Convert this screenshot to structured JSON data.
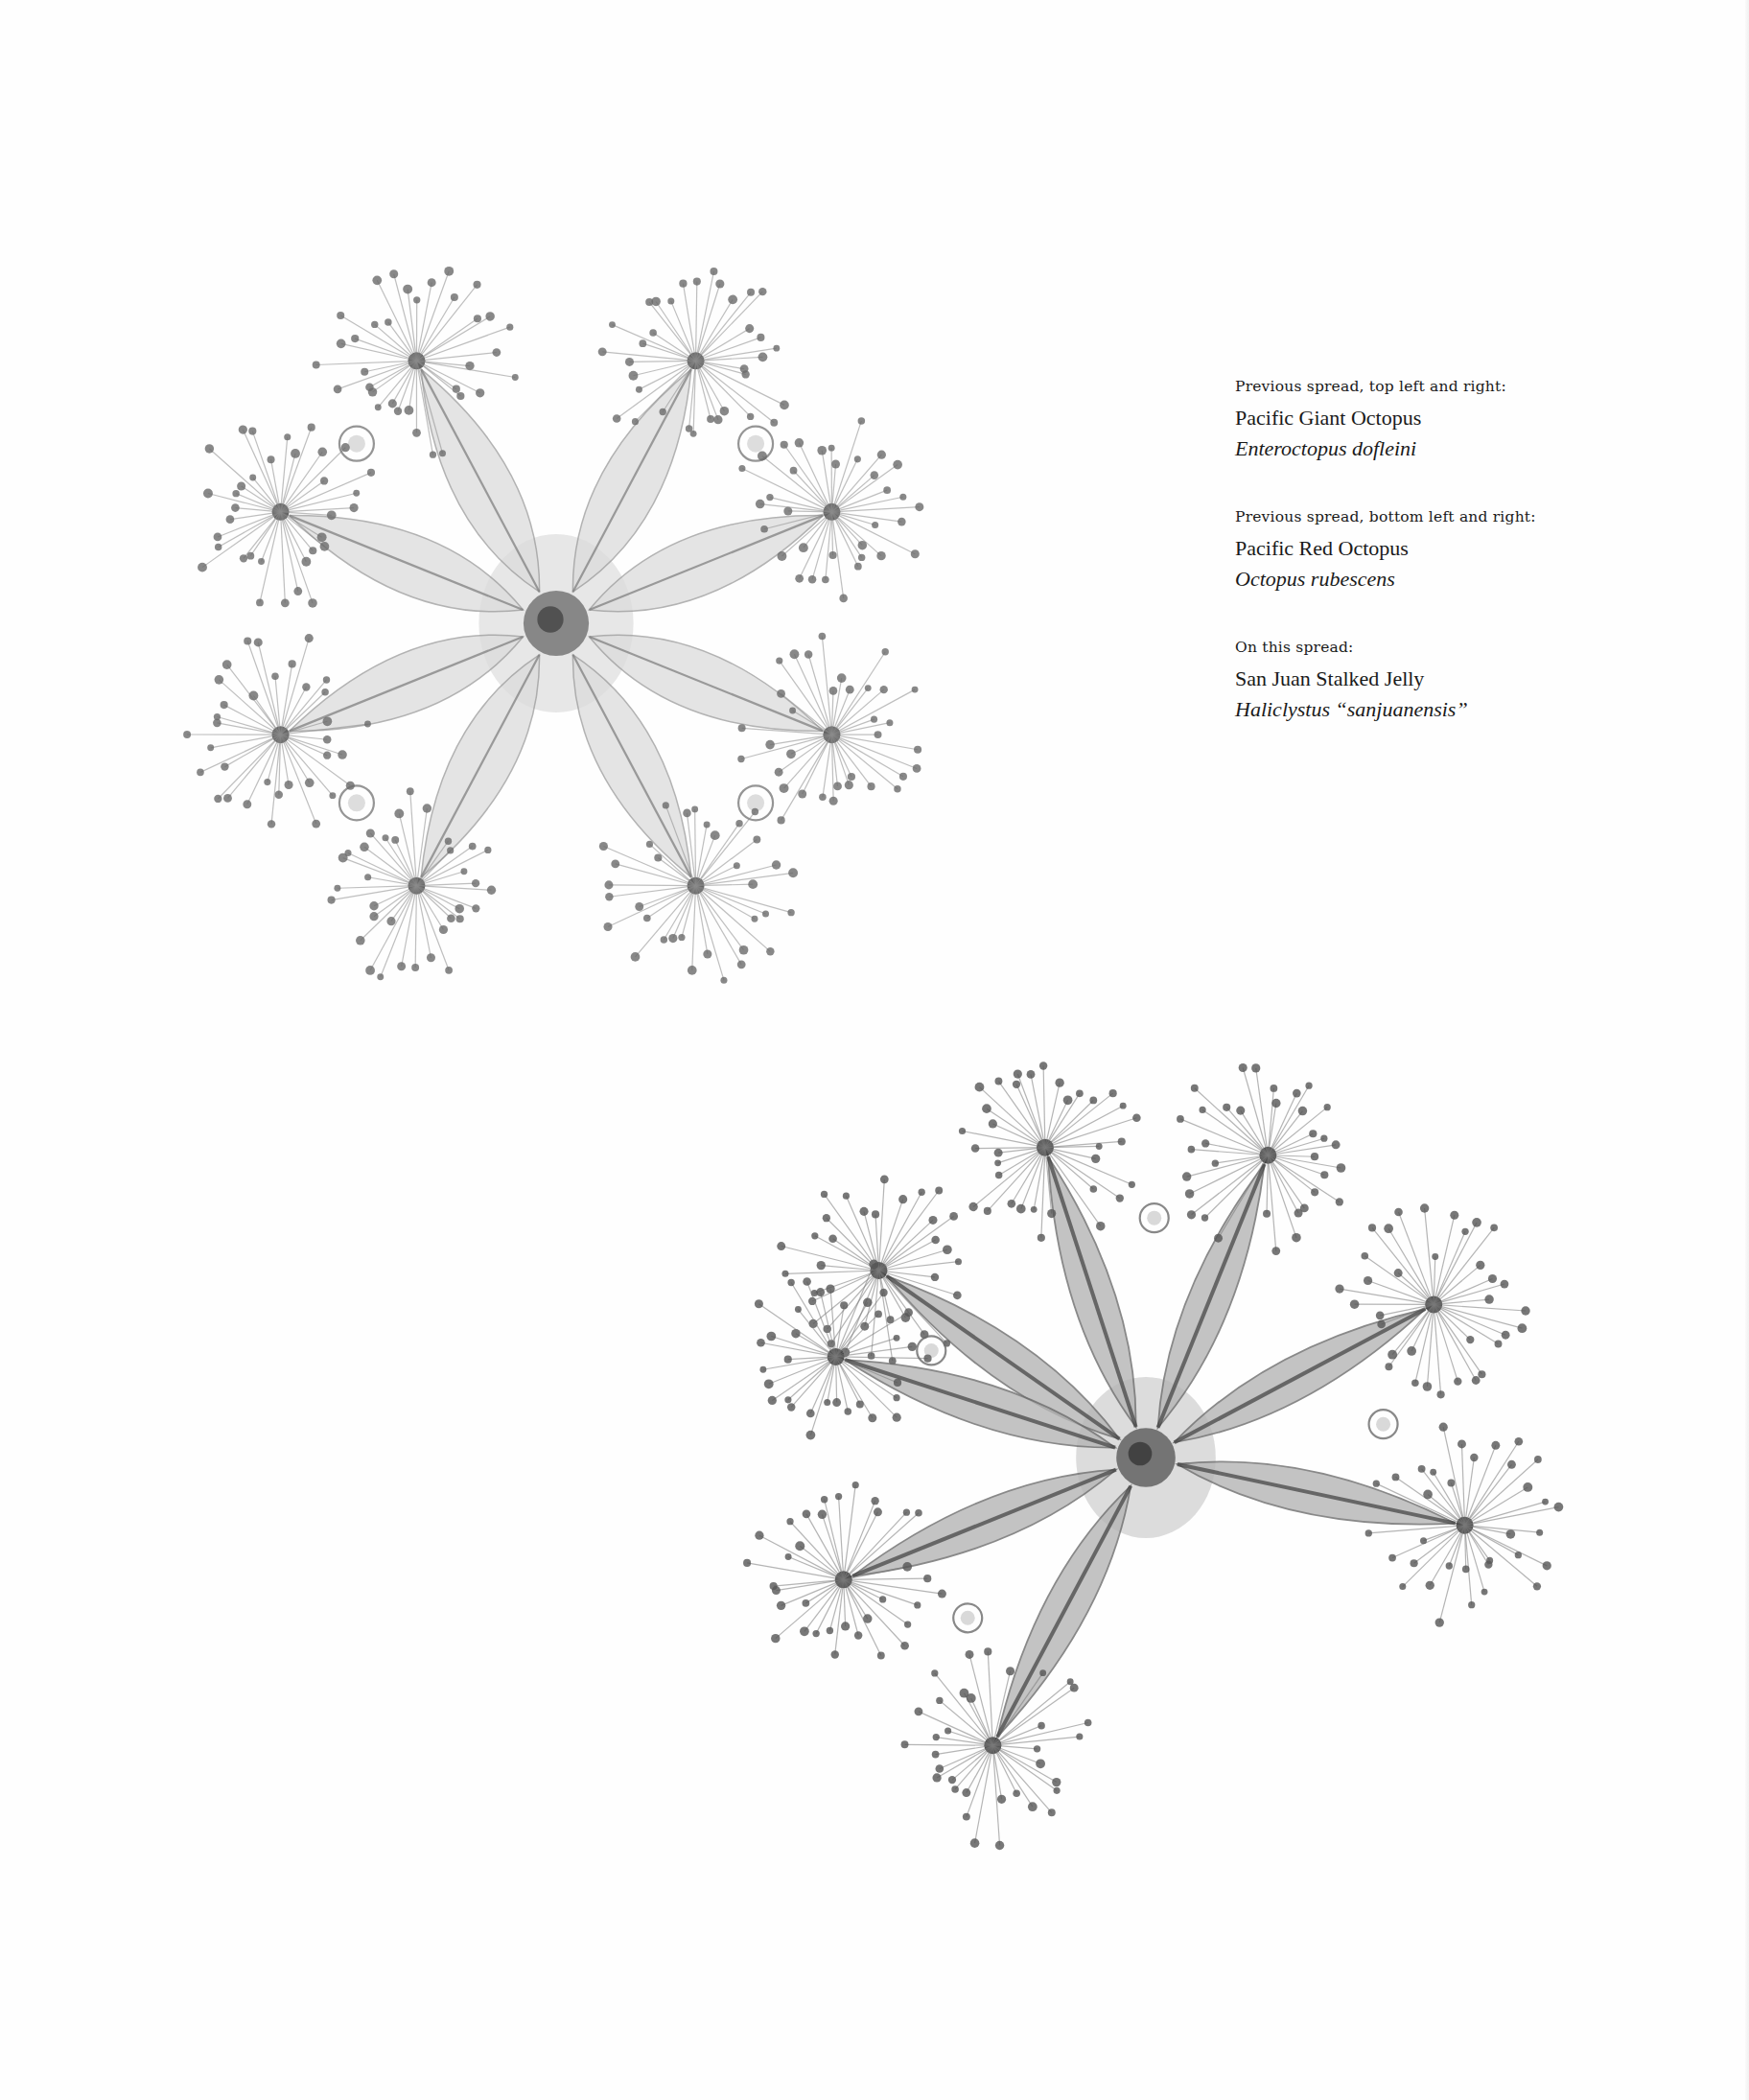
{
  "page": {
    "background": "#fefefe",
    "text_color": "#1a1a1a"
  },
  "images": [
    {
      "id": "jelly-top-left",
      "subject": "San Juan Stalked Jelly",
      "arms": 8,
      "tone": "light"
    },
    {
      "id": "jelly-bottom-right",
      "subject": "San Juan Stalked Jelly",
      "arms": 8,
      "tone": "dark"
    }
  ],
  "captions": [
    {
      "label": "Previous spread, top left and right:",
      "common_name": "Pacific Giant Octopus",
      "scientific_name": "Enteroctopus dofleini"
    },
    {
      "label": "Previous spread, bottom left and right:",
      "common_name": "Pacific Red Octopus",
      "scientific_name": "Octopus rubescens"
    },
    {
      "label": "On this spread:",
      "common_name": "San Juan Stalked Jelly",
      "scientific_name": "Haliclystus “sanjuanensis”"
    }
  ]
}
